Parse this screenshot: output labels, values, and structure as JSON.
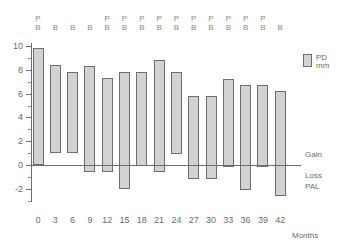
{
  "chart_data": {
    "type": "bar",
    "title": "",
    "xlabel": "Months",
    "ylabel": "",
    "ylim": [
      -3.2,
      10.4
    ],
    "ytick_labels": [
      "10",
      "8",
      "6",
      "4",
      "2",
      "0",
      "-2"
    ],
    "ytick_values": [
      10,
      8,
      6,
      4,
      2,
      0,
      -2
    ],
    "yminor_values": [
      9,
      7,
      5,
      3,
      1,
      -1,
      -3
    ],
    "grid": false,
    "categories": [
      "0",
      "3",
      "6",
      "9",
      "12",
      "15",
      "18",
      "21",
      "24",
      "27",
      "30",
      "33",
      "36",
      "39",
      "42"
    ],
    "x_values": [
      0,
      3,
      6,
      9,
      12,
      15,
      18,
      21,
      24,
      27,
      30,
      33,
      36,
      39,
      42
    ],
    "series": [
      {
        "name": "PD mm",
        "note": "floating bars: each bar spans from its low value to its high value",
        "high": [
          9.8,
          8.4,
          7.85,
          8.3,
          7.3,
          7.8,
          7.8,
          8.85,
          7.85,
          5.8,
          5.8,
          7.2,
          6.75,
          6.75,
          6.25
        ],
        "low": [
          0.0,
          1.0,
          1.0,
          -0.55,
          -0.6,
          -2.05,
          -0.1,
          -0.6,
          0.9,
          -1.15,
          -1.15,
          -0.15,
          -2.1,
          -0.15,
          -2.6
        ]
      }
    ],
    "bar_color": "#d2d2d2",
    "bar_border_color": "#6e6e6e",
    "axis_color": "#6e6e6e",
    "text_color": "#6b6b6b",
    "top_annotations": [
      [
        "P",
        "B"
      ],
      [
        "",
        "B"
      ],
      [
        "",
        "B"
      ],
      [
        "",
        "B"
      ],
      [
        "P",
        "B"
      ],
      [
        "P",
        "B"
      ],
      [
        "P",
        "B"
      ],
      [
        "P",
        "B"
      ],
      [
        "P",
        "B"
      ],
      [
        "P",
        "B"
      ],
      [
        "P",
        "B"
      ],
      [
        "P",
        "B"
      ],
      [
        "P",
        "B"
      ],
      [
        "P",
        "B"
      ],
      [
        "",
        "B"
      ]
    ],
    "side_annotations": [
      {
        "label": "Gain",
        "value": 0.9
      },
      {
        "label": "Loss",
        "value": -0.85
      },
      {
        "label": "PAL",
        "value": -1.75
      }
    ],
    "legend": {
      "position": "top-right",
      "entries": [
        {
          "line1": "PD",
          "line2": "mm",
          "color": "#d2d2d2"
        }
      ]
    }
  }
}
